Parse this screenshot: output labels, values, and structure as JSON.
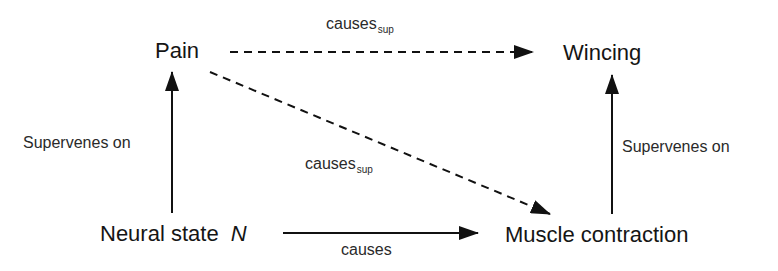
{
  "nodes": {
    "pain": "Pain",
    "wincing": "Wincing",
    "neural_state": "Neural state",
    "neural_var": "N",
    "muscle": "Muscle contraction"
  },
  "edges": {
    "pain_to_wincing": {
      "label": "causes",
      "sub": "sup",
      "style": "dashed"
    },
    "pain_to_muscle": {
      "label": "causes",
      "sub": "sup",
      "style": "dashed"
    },
    "neural_to_muscle": {
      "label": "causes",
      "style": "solid"
    },
    "neural_to_pain": {
      "label": "Supervenes on",
      "style": "solid"
    },
    "muscle_to_wincing": {
      "label": "Supervenes on",
      "style": "solid"
    }
  },
  "colors": {
    "line": "#111111",
    "text": "#151515"
  }
}
